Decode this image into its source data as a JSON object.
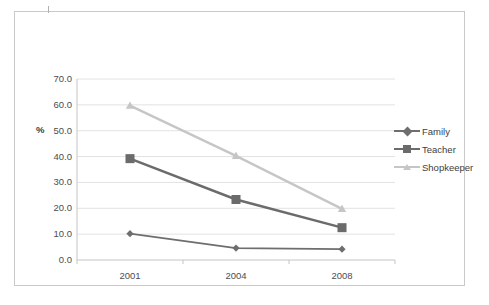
{
  "chart_data": {
    "type": "line",
    "title": "",
    "subtitle": "",
    "xlabel": "",
    "ylabel": "%",
    "categories": [
      "2001",
      "2004",
      "2008"
    ],
    "x_tick_labels": [
      "2001",
      "2004",
      "2008"
    ],
    "y_tick_labels": [
      "0.0",
      "10.0",
      "20.0",
      "30.0",
      "40.0",
      "50.0",
      "60.0",
      "70.0"
    ],
    "y_ticks": [
      0,
      10,
      20,
      30,
      40,
      50,
      60,
      70
    ],
    "ylim": [
      0,
      70
    ],
    "grid": "horizontal",
    "legend_position": "right",
    "series": [
      {
        "name": "Family",
        "values": [
          10.2,
          4.6,
          4.2
        ],
        "color": "#6e6e6e",
        "marker": "diamond"
      },
      {
        "name": "Teacher",
        "values": [
          39.2,
          23.4,
          12.5
        ],
        "color": "#6b6b6b",
        "marker": "square"
      },
      {
        "name": "Shopkeeper",
        "values": [
          59.7,
          40.3,
          19.8
        ],
        "color": "#c6c6c6",
        "marker": "triangle"
      }
    ]
  },
  "legend": {
    "items": [
      {
        "label": "Family"
      },
      {
        "label": "Teacher"
      },
      {
        "label": "Shopkeeper"
      }
    ]
  },
  "axes": {
    "y_title": "%",
    "y_labels": [
      "70.0",
      "60.0",
      "50.0",
      "40.0",
      "30.0",
      "20.0",
      "10.0",
      "0.0"
    ],
    "x_labels": [
      "2001",
      "2004",
      "2008"
    ]
  },
  "colors": {
    "frame_border": "#c9c9c9",
    "gridline": "#e2e2e2",
    "axis_line": "#c4c4c4",
    "tick_text": "#4d4d4d",
    "family_series": "#6e6e6e",
    "teacher_series": "#6b6b6b",
    "shopkeeper_series": "#c6c6c6"
  }
}
